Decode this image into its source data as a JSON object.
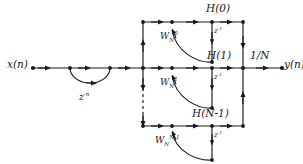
{
  "figure": {
    "type": "signal-flow-diagram",
    "background": "#ffffff",
    "stroke": "#1a1a1a"
  },
  "input": {
    "label": "x(n)",
    "comb_delay_label": "z",
    "comb_delay_exponent": "-n"
  },
  "output": {
    "label": "y(n)",
    "scale_label": "1/N"
  },
  "branches": [
    {
      "id": "branch-0",
      "coefficient_base": "W",
      "coefficient_sub": "N",
      "coefficient_sup": "0",
      "delay_label": "z",
      "delay_exponent": "-1",
      "output_label": "H(0)"
    },
    {
      "id": "branch-1",
      "coefficient_base": "W",
      "coefficient_sub": "N",
      "coefficient_sup": "1",
      "delay_label": "z",
      "delay_exponent": "-1",
      "output_label": "H(1)"
    },
    {
      "id": "branch-n-1",
      "coefficient_base": "W",
      "coefficient_sub": "N",
      "coefficient_sup": "N-1",
      "delay_label": "z",
      "delay_exponent": "-1",
      "output_label": "H(N-1)"
    }
  ],
  "continuation": {
    "style": "dashed-vertical",
    "meaning": "omitted intermediate branches"
  }
}
